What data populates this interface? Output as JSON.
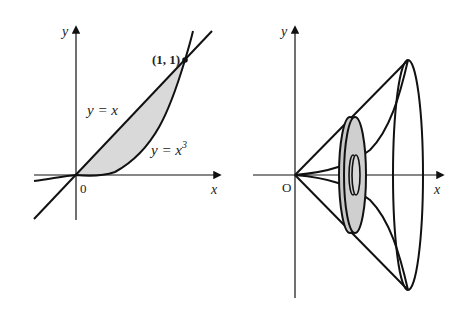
{
  "figure": {
    "left_panel": {
      "axes": {
        "x_label": "x",
        "y_label": "y",
        "origin_label": "0"
      },
      "curves": [
        {
          "name": "line",
          "equation_label": "y = x"
        },
        {
          "name": "cubic",
          "equation_label": "y = x",
          "exponent": "3"
        }
      ],
      "intersection_label": "(1, 1)",
      "shaded_region": "between y = x and y = x^3 for 0 ≤ x ≤ 1",
      "colors": {
        "stroke": "#111111",
        "shade": "#d9d9d9"
      }
    },
    "right_panel": {
      "axes": {
        "x_label": "x",
        "y_label": "y",
        "origin_label": "O"
      },
      "description": "solid of revolution about x-axis with washer cross-section",
      "colors": {
        "stroke": "#111111",
        "washer_fill": "#c8c8c8"
      }
    }
  }
}
